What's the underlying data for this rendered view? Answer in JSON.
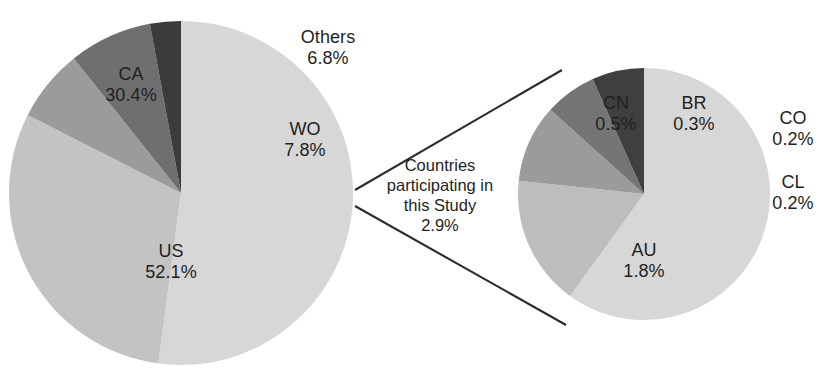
{
  "figure": {
    "title": "",
    "background": "#ffffff",
    "callout_note": {
      "line1": "Countries",
      "line2": "participating in",
      "line3": "this Study",
      "line4": "2.9%"
    }
  },
  "chart_data": [
    {
      "type": "pie",
      "name": "main-pie",
      "title": "",
      "labels": [
        "US",
        "CA",
        "Others",
        "WO",
        "Countries participating in this Study"
      ],
      "values": [
        52.1,
        30.4,
        6.8,
        7.8,
        2.9
      ],
      "value_labels": [
        "52.1%",
        "30.4%",
        "6.8%",
        "7.8%",
        "2.9%"
      ],
      "colors": [
        "#d7d7d7",
        "#c3c3c3",
        "#9b9b9b",
        "#6f6f6f",
        "#3b3b3b"
      ],
      "center": [
        181,
        193
      ],
      "radius": 172,
      "start_angle_deg": -90,
      "direction": "clockwise",
      "legend": "none",
      "exploded_to_secondary": "Countries participating in this Study"
    },
    {
      "type": "pie",
      "name": "detail-pie",
      "title": "",
      "labels": [
        "AU",
        "CN",
        "BR",
        "CO",
        "CL"
      ],
      "values": [
        1.8,
        0.5,
        0.3,
        0.2,
        0.2
      ],
      "value_labels": [
        "1.8%",
        "0.5%",
        "0.3%",
        "0.2%",
        "0.2%"
      ],
      "colors": [
        "#d7d7d7",
        "#bdbdbd",
        "#9b9b9b",
        "#757575",
        "#3f3f3f"
      ],
      "center": [
        644,
        194
      ],
      "radius": 126,
      "start_angle_deg": -90,
      "direction": "clockwise",
      "legend": "none",
      "parent_slice": "Countries participating in this Study",
      "parent_share_percent": 2.9
    }
  ],
  "labels_main": [
    {
      "name": "CA",
      "value": "30.4%"
    },
    {
      "name": "Others",
      "value": "6.8%"
    },
    {
      "name": "WO",
      "value": "7.8%"
    },
    {
      "name": "US",
      "value": "52.1%"
    }
  ],
  "labels_detail": [
    {
      "name": "CN",
      "value": "0.5%"
    },
    {
      "name": "BR",
      "value": "0.3%"
    },
    {
      "name": "CO",
      "value": "0.2%"
    },
    {
      "name": "CL",
      "value": "0.2%"
    },
    {
      "name": "AU",
      "value": "1.8%"
    }
  ]
}
